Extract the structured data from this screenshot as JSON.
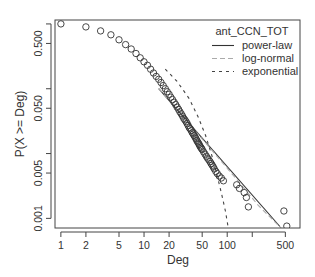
{
  "chart_data": {
    "type": "scatter",
    "title": "",
    "xlabel": "Deg",
    "ylabel": "P(X >= Deg)",
    "xscale": "log",
    "yscale": "log",
    "xlim": [
      0.85,
      750
    ],
    "ylim": [
      0.00071,
      1.15
    ],
    "x_ticks": [
      {
        "value": 1,
        "label": "1"
      },
      {
        "value": 2,
        "label": "2"
      },
      {
        "value": 5,
        "label": "5"
      },
      {
        "value": 10,
        "label": "10"
      },
      {
        "value": 20,
        "label": "20"
      },
      {
        "value": 50,
        "label": "50"
      },
      {
        "value": 100,
        "label": "100"
      },
      {
        "value": 200,
        "label": ""
      },
      {
        "value": 500,
        "label": "500"
      }
    ],
    "y_ticks": [
      {
        "value": 1.0,
        "label": ""
      },
      {
        "value": 0.5,
        "label": "0.500"
      },
      {
        "value": 0.1,
        "label": ""
      },
      {
        "value": 0.05,
        "label": "0.050"
      },
      {
        "value": 0.01,
        "label": ""
      },
      {
        "value": 0.005,
        "label": "0.005"
      },
      {
        "value": 0.001,
        "label": "0.001"
      }
    ],
    "grid": false,
    "legend": {
      "title": "ant_CCN_TOT",
      "position": "top-right",
      "entries": [
        {
          "label": "power-law",
          "style": "solid",
          "color": "#333333"
        },
        {
          "label": "log-normal",
          "style": "dashed",
          "color": "#999999"
        },
        {
          "label": "exponential",
          "style": "dotted",
          "color": "#444444"
        }
      ]
    },
    "points": {
      "name": "empirical CCDF",
      "x": [
        1,
        2,
        3,
        4,
        5,
        6,
        7,
        8,
        9,
        10,
        11,
        12,
        13,
        14,
        15,
        16,
        17,
        18,
        19,
        20,
        21,
        22,
        23,
        24,
        25,
        26,
        27,
        28,
        29,
        30,
        31,
        32,
        33,
        34,
        35,
        36,
        37,
        38,
        39,
        40,
        41,
        42,
        43,
        44,
        45,
        46,
        47,
        48,
        49,
        50,
        52,
        54,
        56,
        58,
        60,
        62,
        64,
        66,
        68,
        70,
        73,
        76,
        80,
        85,
        90,
        130,
        140,
        160,
        170,
        180,
        480,
        520
      ],
      "y": [
        1.0,
        0.9,
        0.78,
        0.68,
        0.57,
        0.48,
        0.41,
        0.35,
        0.3,
        0.26,
        0.23,
        0.2,
        0.175,
        0.155,
        0.14,
        0.125,
        0.112,
        0.1,
        0.09,
        0.082,
        0.074,
        0.068,
        0.062,
        0.057,
        0.052,
        0.048,
        0.044,
        0.041,
        0.038,
        0.035,
        0.033,
        0.031,
        0.029,
        0.027,
        0.025,
        0.024,
        0.0225,
        0.021,
        0.02,
        0.019,
        0.018,
        0.017,
        0.016,
        0.0152,
        0.0145,
        0.0138,
        0.0131,
        0.0125,
        0.012,
        0.0115,
        0.0106,
        0.0098,
        0.0091,
        0.0085,
        0.008,
        0.0075,
        0.007,
        0.0066,
        0.0062,
        0.0058,
        0.0053,
        0.0049,
        0.0045,
        0.0042,
        0.0038,
        0.0033,
        0.0029,
        0.0025,
        0.0021,
        0.0015,
        0.0013,
        0.00076
      ]
    },
    "series": [
      {
        "name": "power-law",
        "x": [
          15,
          430
        ],
        "y": [
          0.1,
          0.00075
        ]
      },
      {
        "name": "log-normal",
        "x": [
          15,
          30,
          60,
          120,
          240,
          445
        ],
        "y": [
          0.1,
          0.036,
          0.0128,
          0.0045,
          0.00155,
          0.00071
        ]
      },
      {
        "name": "exponential",
        "x": [
          18,
          25,
          35,
          45,
          55,
          65,
          75,
          85,
          95,
          103
        ],
        "y": [
          0.2,
          0.13,
          0.07,
          0.036,
          0.019,
          0.0095,
          0.0048,
          0.0025,
          0.0013,
          0.00071
        ]
      }
    ]
  }
}
